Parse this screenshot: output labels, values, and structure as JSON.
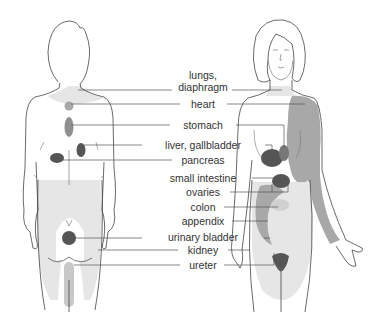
{
  "diagram": {
    "colors": {
      "outline": "#444444",
      "light_fill": "#e6e6e6",
      "medium_fill": "#a8a8a8",
      "dark_fill": "#555555",
      "line": "#555555",
      "text": "#333333"
    },
    "figures": [
      {
        "name": "back-view",
        "label": ""
      },
      {
        "name": "front-view",
        "label": ""
      }
    ],
    "labels": [
      {
        "id": "lungs",
        "text": "lungs,",
        "x": 203,
        "y": 70
      },
      {
        "id": "diaphragm",
        "text": "diaphragm",
        "x": 203,
        "y": 82
      },
      {
        "id": "heart",
        "text": "heart",
        "x": 203,
        "y": 99
      },
      {
        "id": "stomach",
        "text": "stomach",
        "x": 203,
        "y": 121
      },
      {
        "id": "liver-gallbladder",
        "text": "liver, gallbladder",
        "x": 203,
        "y": 141
      },
      {
        "id": "pancreas",
        "text": "pancreas",
        "x": 203,
        "y": 159
      },
      {
        "id": "small-intestine",
        "text": "small intestine",
        "x": 203,
        "y": 177
      },
      {
        "id": "ovaries",
        "text": "ovaries",
        "x": 203,
        "y": 192
      },
      {
        "id": "colon",
        "text": "colon",
        "x": 203,
        "y": 207
      },
      {
        "id": "appendix",
        "text": "appendix",
        "x": 203,
        "y": 221
      },
      {
        "id": "urinary-bladder",
        "text": "urinary bladder",
        "x": 203,
        "y": 236
      },
      {
        "id": "kidney",
        "text": "kidney",
        "x": 203,
        "y": 250
      },
      {
        "id": "ureter",
        "text": "ureter",
        "x": 203,
        "y": 265
      }
    ]
  }
}
